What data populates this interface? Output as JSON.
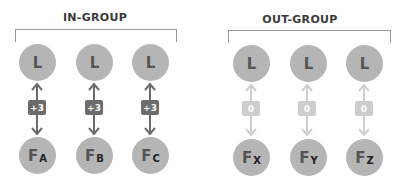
{
  "groups": [
    {
      "label": "IN-GROUP",
      "style": "strong",
      "arrow_color": "#6b6b6b",
      "members": [
        {
          "top": "L",
          "bottom_main": "F",
          "bottom_sub": "A",
          "badge": "+3"
        },
        {
          "top": "L",
          "bottom_main": "F",
          "bottom_sub": "B",
          "badge": "+3"
        },
        {
          "top": "L",
          "bottom_main": "F",
          "bottom_sub": "C",
          "badge": "+3"
        }
      ]
    },
    {
      "label": "OUT-GROUP",
      "style": "weak",
      "arrow_color": "#cfcfcf",
      "members": [
        {
          "top": "L",
          "bottom_main": "F",
          "bottom_sub": "X",
          "badge": "0"
        },
        {
          "top": "L",
          "bottom_main": "F",
          "bottom_sub": "Y",
          "badge": "0"
        },
        {
          "top": "L",
          "bottom_main": "F",
          "bottom_sub": "Z",
          "badge": "0"
        }
      ]
    }
  ],
  "colors": {
    "circle_fill": "#b5b5b5",
    "strong_badge": "#6b6b6b",
    "weak_badge": "#cdcdcd",
    "bracket": "#9a9a9a"
  }
}
